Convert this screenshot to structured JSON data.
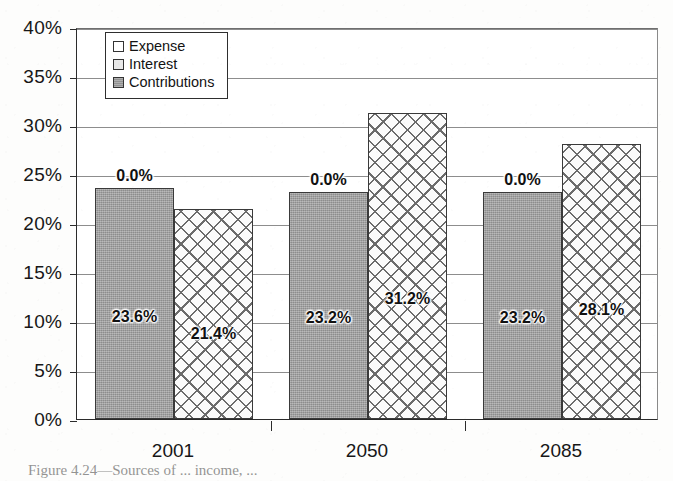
{
  "figure": {
    "caption": "Figure 4.24—Sources of ... income, ..."
  },
  "legend": {
    "position": "inside-top-left",
    "items": [
      {
        "label": "Expense",
        "swatch": "white",
        "swatch_class": "sw-white"
      },
      {
        "label": "Interest",
        "swatch": "light-gray",
        "swatch_class": "sw-lightgray"
      },
      {
        "label": "Contributions",
        "swatch": "gray",
        "swatch_class": "sw-gray"
      }
    ]
  },
  "axes": {
    "y_ticks": [
      "0%",
      "5%",
      "10%",
      "15%",
      "20%",
      "25%",
      "30%",
      "35%",
      "40%"
    ],
    "x_ticks": [
      "2001",
      "2050",
      "2085"
    ]
  },
  "colors": {
    "contributions_fill": "#9b9b9b",
    "interest_fill": "#fbfbfb",
    "interest_hatch": "#6c6c6c",
    "expense_fill": "#ffffff",
    "axis": "#2b2b2b",
    "gridline": "#8d8d8d",
    "text": "#171717"
  },
  "chart_data": {
    "type": "bar",
    "title": "",
    "subtitle": "",
    "xlabel": "",
    "ylabel": "",
    "categories": [
      "2001",
      "2050",
      "2085"
    ],
    "series": [
      {
        "name": "Expense",
        "values": [
          0.0,
          0.0,
          0.0
        ],
        "labels": [
          "0.0%",
          "0.0%",
          "0.0%"
        ],
        "fill": "white",
        "rendered": false
      },
      {
        "name": "Contributions",
        "values": [
          23.6,
          23.2,
          23.2
        ],
        "labels": [
          "23.6%",
          "23.2%",
          "23.2%"
        ],
        "fill": "solid-gray",
        "rendered": true
      },
      {
        "name": "Interest",
        "values": [
          21.4,
          31.2,
          28.1
        ],
        "labels": [
          "21.4%",
          "31.2%",
          "28.1%"
        ],
        "fill": "crosshatch",
        "rendered": true
      }
    ],
    "ylim": [
      0,
      40
    ],
    "ytick_step": 5,
    "ytick_format": "percent",
    "grid": true,
    "grid_axis": "y",
    "legend_position": "upper left (inside plot area)",
    "annotations": [
      {
        "text": "0.0%",
        "series": "Expense",
        "category": "2001",
        "placement": "above-contributions-bar"
      },
      {
        "text": "0.0%",
        "series": "Expense",
        "category": "2050",
        "placement": "above-contributions-bar"
      },
      {
        "text": "0.0%",
        "series": "Expense",
        "category": "2085",
        "placement": "above-contributions-bar"
      }
    ]
  }
}
